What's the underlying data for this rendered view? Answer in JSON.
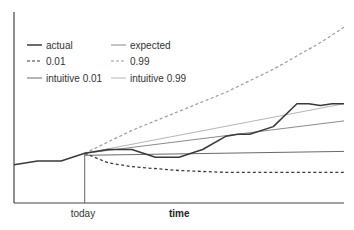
{
  "chart_data": {
    "type": "line",
    "title": "",
    "xlabel": "time",
    "ylabel": "",
    "x_annotation": "today",
    "xlim": [
      0,
      28
    ],
    "ylim": [
      0,
      100
    ],
    "today_x": 6,
    "grid": false,
    "legend": "top-left",
    "legend_entries": [
      {
        "name": "actual",
        "style": "solid-dark"
      },
      {
        "name": "expected",
        "style": "solid-gray"
      },
      {
        "name": "0.01",
        "style": "dashed-dark"
      },
      {
        "name": "0.99",
        "style": "dashed-light"
      },
      {
        "name": "intuitive 0.01",
        "style": "solid-mid"
      },
      {
        "name": "intuitive 0.99",
        "style": "solid-light"
      }
    ],
    "series": [
      {
        "name": "actual",
        "color": "#3a3a3a",
        "dash": false,
        "x": [
          0,
          2,
          4,
          6,
          8,
          10,
          12,
          14,
          16,
          18,
          19,
          20,
          22,
          24,
          25,
          26,
          27,
          28
        ],
        "y": [
          20,
          22,
          22,
          26,
          28,
          28,
          24,
          24,
          28,
          35,
          36,
          36,
          40,
          52,
          52,
          51,
          52,
          52
        ]
      },
      {
        "name": "expected",
        "color": "#8a8a8a",
        "dash": false,
        "x": [
          6,
          28
        ],
        "y": [
          26,
          43
        ]
      },
      {
        "name": "0.01",
        "color": "#3a3a3a",
        "dash": true,
        "x": [
          6,
          8,
          10,
          14,
          18,
          22,
          28
        ],
        "y": [
          26,
          21,
          19,
          17,
          16,
          16,
          16
        ]
      },
      {
        "name": "0.99",
        "color": "#9a9a9a",
        "dash": true,
        "x": [
          6,
          10,
          14,
          18,
          22,
          26,
          28
        ],
        "y": [
          26,
          38,
          48,
          58,
          70,
          84,
          92
        ]
      },
      {
        "name": "intuitive 0.01",
        "color": "#6a6a6a",
        "dash": false,
        "x": [
          6,
          28
        ],
        "y": [
          25,
          27
        ]
      },
      {
        "name": "intuitive 0.99",
        "color": "#b5b5b5",
        "dash": false,
        "x": [
          6,
          28
        ],
        "y": [
          26,
          52
        ]
      }
    ]
  }
}
